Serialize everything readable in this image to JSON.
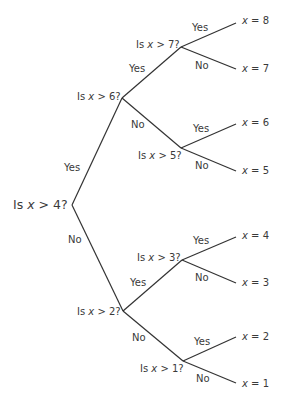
{
  "diagram": {
    "type": "binary-decision-tree",
    "line_color": "#333333",
    "text_color": "#3a3a3a",
    "root": {
      "question_prefix": "Is ",
      "var": "x",
      "question_suffix": " > 4?"
    },
    "nodes": {
      "n6": {
        "question_prefix": "Is ",
        "var": "x",
        "question_suffix": " > 6?"
      },
      "n7": {
        "question_prefix": "Is ",
        "var": "x",
        "question_suffix": " > 7?"
      },
      "n5": {
        "question_prefix": "Is ",
        "var": "x",
        "question_suffix": " > 5?"
      },
      "n2": {
        "question_prefix": "Is ",
        "var": "x",
        "question_suffix": " > 2?"
      },
      "n3": {
        "question_prefix": "Is ",
        "var": "x",
        "question_suffix": " > 3?"
      },
      "n1": {
        "question_prefix": "Is ",
        "var": "x",
        "question_suffix": " > 1?"
      }
    },
    "branch_labels": {
      "yes": "Yes",
      "no": "No"
    },
    "leaves": [
      {
        "var": "x",
        "value": " = 8"
      },
      {
        "var": "x",
        "value": " = 7"
      },
      {
        "var": "x",
        "value": " = 6"
      },
      {
        "var": "x",
        "value": " = 5"
      },
      {
        "var": "x",
        "value": " = 4"
      },
      {
        "var": "x",
        "value": " = 3"
      },
      {
        "var": "x",
        "value": " = 2"
      },
      {
        "var": "x",
        "value": " = 1"
      }
    ]
  }
}
